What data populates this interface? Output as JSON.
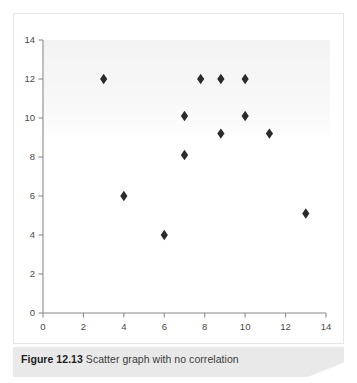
{
  "figure": {
    "caption_label": "Figure 12.13",
    "caption_text": "Scatter graph with no correlation"
  },
  "chart_data": {
    "type": "scatter",
    "title": "",
    "xlabel": "",
    "ylabel": "",
    "xlim": [
      0,
      14
    ],
    "ylim": [
      0,
      14
    ],
    "xticks": [
      0,
      2,
      4,
      6,
      8,
      10,
      12,
      14
    ],
    "yticks": [
      0,
      2,
      4,
      6,
      8,
      10,
      12,
      14
    ],
    "xtick_labels": [
      "0",
      "2",
      "4",
      "6",
      "8",
      "10",
      "12",
      "14"
    ],
    "ytick_labels": [
      "0",
      "2",
      "4",
      "6",
      "8",
      "10",
      "12",
      "14"
    ],
    "grid": false,
    "legend": null,
    "marker": "diamond",
    "marker_color": "#2b2b2b",
    "series": [
      {
        "name": "data",
        "points": [
          {
            "x": 3,
            "y": 12
          },
          {
            "x": 4,
            "y": 6
          },
          {
            "x": 6,
            "y": 4
          },
          {
            "x": 7,
            "y": 10.1
          },
          {
            "x": 7,
            "y": 8.1
          },
          {
            "x": 7.8,
            "y": 12
          },
          {
            "x": 8.8,
            "y": 12
          },
          {
            "x": 8.8,
            "y": 9.2
          },
          {
            "x": 10,
            "y": 12
          },
          {
            "x": 10,
            "y": 10.1
          },
          {
            "x": 11.2,
            "y": 9.2
          },
          {
            "x": 13,
            "y": 5.1
          }
        ]
      }
    ]
  }
}
